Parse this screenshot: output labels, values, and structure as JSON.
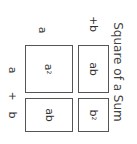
{
  "title": "Square of a Sum",
  "side_labels": {
    "top_a": "a",
    "top_b": "+b",
    "left_a": "a",
    "left_plus": "+",
    "left_b": "b"
  },
  "boxes": [
    {
      "id": "a-squared",
      "base": "a",
      "exp": "2"
    },
    {
      "id": "ab-right",
      "text": "ab"
    },
    {
      "id": "ab-bottom",
      "text": "ab"
    },
    {
      "id": "b-squared",
      "base": "b",
      "exp": "2"
    }
  ],
  "orientation": "rotated 90deg clockwise"
}
